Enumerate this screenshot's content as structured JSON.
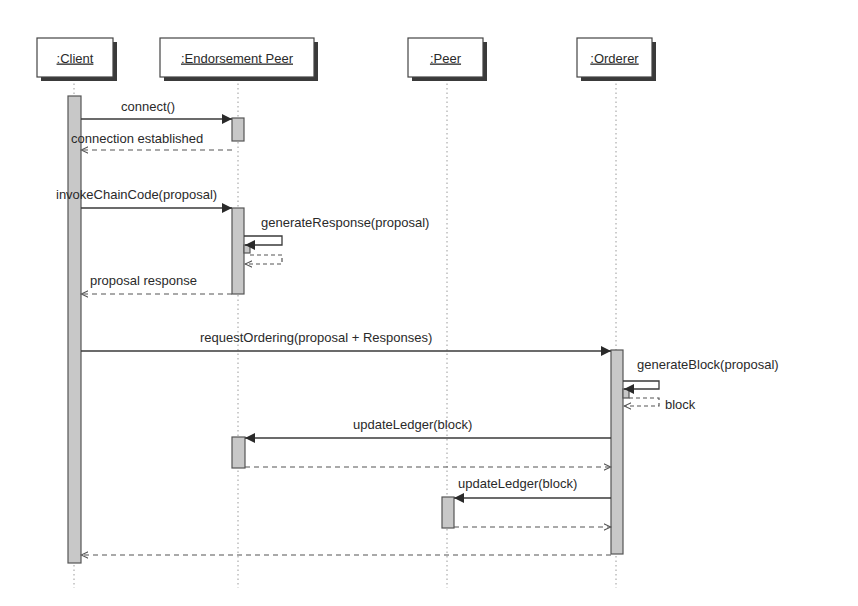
{
  "diagram": {
    "type": "uml-sequence",
    "colors": {
      "line": "#3a3a3a",
      "activation_fill": "#c8c8c8",
      "shadow": "#3a3a3a",
      "lifeline": "#9a9a9a",
      "text": "#2a2a2a"
    },
    "participants": [
      {
        "id": "client",
        "label": ":Client",
        "box": [
          37,
          38,
          76,
          39
        ],
        "x": 74
      },
      {
        "id": "endorsement_peer",
        "label": ":Endorsement Peer",
        "box": [
          160,
          38,
          154,
          39
        ],
        "x": 238
      },
      {
        "id": "peer",
        "label": ":Peer",
        "box": [
          408,
          38,
          75,
          39
        ],
        "x": 447
      },
      {
        "id": "orderer",
        "label": ":Orderer",
        "box": [
          577,
          38,
          75,
          39
        ],
        "x": 616
      }
    ],
    "lifeline_end_y": 588,
    "activations": [
      {
        "on": "client",
        "x": 68,
        "y": 96,
        "w": 13,
        "h": 467
      },
      {
        "on": "endorsement_peer",
        "x": 232,
        "y": 118,
        "w": 12,
        "h": 23
      },
      {
        "on": "endorsement_peer",
        "x": 232,
        "y": 208,
        "w": 12,
        "h": 86
      },
      {
        "on": "endorsement_peer",
        "x": 244,
        "y": 245,
        "w": 6,
        "h": 8
      },
      {
        "on": "orderer",
        "x": 611,
        "y": 350,
        "w": 12,
        "h": 204
      },
      {
        "on": "orderer",
        "x": 623,
        "y": 389,
        "w": 6,
        "h": 9
      },
      {
        "on": "endorsement_peer",
        "x": 232,
        "y": 437,
        "w": 13,
        "h": 31
      },
      {
        "on": "peer",
        "x": 442,
        "y": 497,
        "w": 12,
        "h": 31
      }
    ],
    "messages": [
      {
        "label": "connect()",
        "kind": "sync",
        "x1": 81,
        "x2": 232,
        "y": 119,
        "label_x": 121,
        "label_y": 111
      },
      {
        "label": "connection established",
        "kind": "return",
        "x1": 232,
        "x2": 81,
        "y": 150,
        "label_x": 71,
        "label_y": 143
      },
      {
        "label": "invokeChainCode(proposal)",
        "kind": "sync",
        "x1": 81,
        "x2": 232,
        "y": 208,
        "label_x": 56,
        "label_y": 199
      },
      {
        "label": "generateResponse(proposal)",
        "kind": "self",
        "x1": 244,
        "x2": 282,
        "y_top": 236,
        "y": 245,
        "label_x": 261,
        "label_y": 227
      },
      {
        "label": "",
        "kind": "self-return",
        "x1": 250,
        "x2": 282,
        "y_top": 255,
        "y": 264
      },
      {
        "label": "proposal response",
        "kind": "return",
        "x1": 232,
        "x2": 81,
        "y": 294,
        "label_x": 90,
        "label_y": 285
      },
      {
        "label": "requestOrdering(proposal + Responses)",
        "kind": "sync",
        "x1": 81,
        "x2": 611,
        "y": 351,
        "label_x": 200,
        "label_y": 342
      },
      {
        "label": "generateBlock(proposal)",
        "kind": "self",
        "x1": 623,
        "x2": 659,
        "y_top": 381,
        "y": 389,
        "label_x": 637,
        "label_y": 369
      },
      {
        "label": "block",
        "kind": "self-return",
        "x1": 629,
        "x2": 659,
        "y_top": 398,
        "y": 406,
        "label_x": 665,
        "label_y": 409
      },
      {
        "label": "updateLedger(block)",
        "kind": "sync",
        "x1": 611,
        "x2": 245,
        "y": 438,
        "label_x": 353,
        "label_y": 429
      },
      {
        "label": "",
        "kind": "return",
        "x1": 245,
        "x2": 611,
        "y": 467
      },
      {
        "label": "updateLedger(block)",
        "kind": "sync",
        "x1": 611,
        "x2": 454,
        "y": 498,
        "label_x": 458,
        "label_y": 488
      },
      {
        "label": "",
        "kind": "return",
        "x1": 454,
        "x2": 611,
        "y": 527
      },
      {
        "label": "",
        "kind": "return",
        "x1": 611,
        "x2": 81,
        "y": 555
      }
    ]
  }
}
